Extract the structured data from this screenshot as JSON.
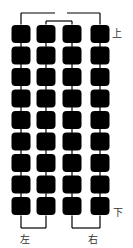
{
  "diagram": {
    "columns": 4,
    "rows": 9,
    "column_x": [
      21,
      46,
      72,
      100
    ],
    "row_y_start": 34,
    "row_pitch": 21.5,
    "cell_size": 19,
    "cell_color": "#000000",
    "wire_color": "#000000"
  },
  "labels": {
    "top": "上",
    "bottom": "下",
    "left": "左",
    "right": "右"
  }
}
